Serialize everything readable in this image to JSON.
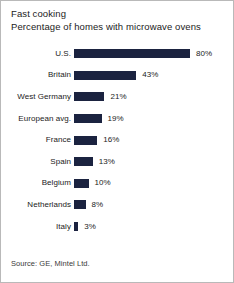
{
  "card": {
    "border_color": "#b9b9b9",
    "background": "#ffffff"
  },
  "header": {
    "title": "Fast cooking",
    "subtitle": "Percentage of homes with microwave ovens"
  },
  "footer": {
    "source": "Source: GE, Mintel Ltd."
  },
  "chart_data": {
    "type": "bar",
    "orientation": "horizontal",
    "title": "Fast cooking",
    "subtitle": "Percentage of homes with microwave ovens",
    "xlabel": "",
    "ylabel": "",
    "xlim": [
      0,
      80
    ],
    "grid": false,
    "legend": null,
    "bar_color": "#1b2340",
    "value_suffix": "%",
    "categories": [
      "U.S.",
      "Britain",
      "West Germany",
      "European avg.",
      "France",
      "Spain",
      "Belgium",
      "Netherlands",
      "Italy"
    ],
    "values": [
      80,
      43,
      21,
      19,
      16,
      13,
      10,
      8,
      3
    ],
    "value_labels": [
      "80%",
      "43%",
      "21%",
      "19%",
      "16%",
      "13%",
      "10%",
      "8%",
      "3%"
    ],
    "source": "Source: GE, Mintel Ltd."
  }
}
